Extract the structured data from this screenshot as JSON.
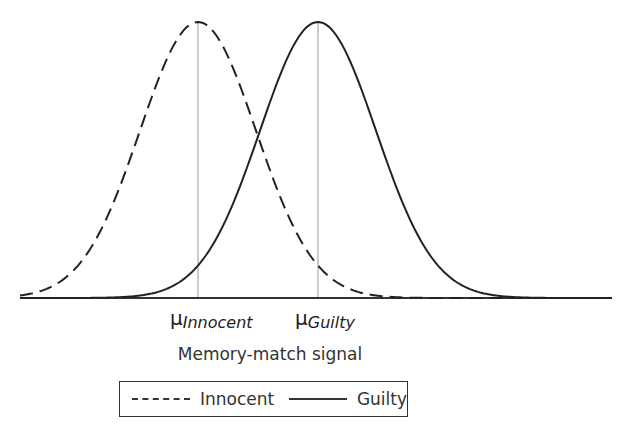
{
  "chart_data": {
    "type": "line",
    "title": "",
    "xlabel": "Memory-match signal",
    "ylabel": "",
    "grid": false,
    "legend_position": "bottom",
    "axis": {
      "baseline_y_px": 298,
      "x_start_px": 20,
      "x_end_px": 612
    },
    "series": [
      {
        "name": "Innocent",
        "style": "dashed",
        "distribution": "normal",
        "mean_px": 198,
        "sd_px": 58,
        "peak_y_px": 22
      },
      {
        "name": "Guilty",
        "style": "solid",
        "distribution": "normal",
        "mean_px": 318,
        "sd_px": 58,
        "peak_y_px": 22
      }
    ],
    "annotations": [
      {
        "symbol": "μ",
        "subscript": "Innocent",
        "x_px": 198
      },
      {
        "symbol": "μ",
        "subscript": "Guilty",
        "x_px": 318
      }
    ]
  },
  "labels": {
    "mu_innocent_symbol": "μ",
    "mu_innocent_sub": "Innocent",
    "mu_guilty_symbol": "μ",
    "mu_guilty_sub": "Guilty",
    "xlabel": "Memory-match signal"
  },
  "legend": {
    "items": [
      {
        "label": "Innocent",
        "style": "dashed"
      },
      {
        "label": "Guilty",
        "style": "solid"
      }
    ]
  },
  "colors": {
    "line": "#222222",
    "mean_line": "#999999",
    "background": "#ffffff"
  }
}
